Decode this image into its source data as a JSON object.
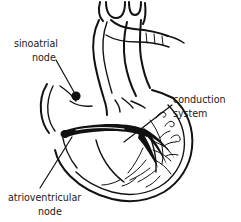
{
  "figure": {
    "background_color": "#ffffff",
    "ink_color": "#111111",
    "style": "black-and-white line drawing"
  },
  "labels": {
    "sinoatrial": {
      "line1": "sinoatrial",
      "line2": "node"
    },
    "conduction": {
      "line1": "conduction",
      "line2": "system"
    },
    "atrioventricular": {
      "line1": "atrioventricular",
      "line2": "node"
    }
  },
  "parts": [
    {
      "name": "aortic-arch",
      "description": "great vessels at top of heart"
    },
    {
      "name": "sinoatrial-node-marker",
      "description": "filled black dot in right atrium"
    },
    {
      "name": "conduction-bundle",
      "description": "thick black band across the atrioventricular groove"
    },
    {
      "name": "purkinje-fibers",
      "description": "branching fiber network in the ventricle wall"
    },
    {
      "name": "ventricle-outline",
      "description": "outer heart wall contour"
    }
  ]
}
